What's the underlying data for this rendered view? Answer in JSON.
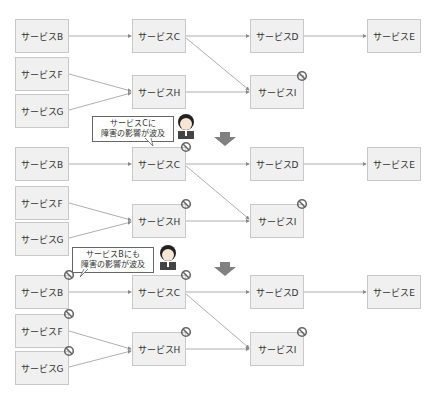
{
  "nodes": {
    "B": "サービスB",
    "C": "サービスC",
    "D": "サービスD",
    "E": "サービスE",
    "F": "サービスF",
    "G": "サービスG",
    "H": "サービスH",
    "I": "サービスI"
  },
  "stages": [
    {
      "blocked": [
        "I"
      ],
      "bubble": null
    },
    {
      "blocked": [
        "C",
        "H",
        "I"
      ],
      "bubble": {
        "line1": "サービスCに",
        "line2": "障害の影響が波及"
      }
    },
    {
      "blocked": [
        "B",
        "C",
        "F",
        "G",
        "H",
        "I"
      ],
      "bubble": {
        "line1": "サービスBにも",
        "line2": "障害の影響が波及"
      }
    }
  ],
  "edges": [
    [
      "B",
      "C"
    ],
    [
      "C",
      "D"
    ],
    [
      "D",
      "E"
    ],
    [
      "C",
      "I"
    ],
    [
      "F",
      "H"
    ],
    [
      "G",
      "H"
    ],
    [
      "H",
      "I"
    ]
  ],
  "colors": {
    "node_fill": "#f0f0f0",
    "node_border": "#c8c8c8",
    "edge": "#888888",
    "block_icon": "#666666",
    "down_arrow": "#808080"
  }
}
